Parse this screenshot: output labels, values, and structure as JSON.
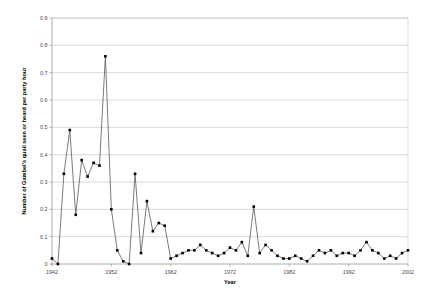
{
  "chart_data": {
    "type": "line",
    "title": "",
    "xlabel": "Year",
    "ylabel": "Number of Gambel's quail seen or heard per party hour",
    "xlim": [
      1942,
      2002
    ],
    "ylim": [
      0,
      0.9
    ],
    "grid": true,
    "legend": false,
    "marker": "square",
    "marker_color": "#000000",
    "line_color": "#595959",
    "gridline_color": "#c8c8c8",
    "x_ticks": [
      "1942",
      "1952",
      "1962",
      "1972",
      "1982",
      "1992",
      "2002"
    ],
    "y_ticks": [
      "0",
      "0.1",
      "0.2",
      "0.3",
      "0.4",
      "0.5",
      "0.6",
      "0.7",
      "0.8",
      "0.9"
    ],
    "x": [
      1942,
      1943,
      1944,
      1945,
      1946,
      1947,
      1948,
      1949,
      1950,
      1951,
      1952,
      1953,
      1954,
      1955,
      1956,
      1957,
      1958,
      1959,
      1960,
      1961,
      1962,
      1963,
      1964,
      1965,
      1966,
      1967,
      1968,
      1969,
      1970,
      1971,
      1972,
      1973,
      1974,
      1975,
      1976,
      1977,
      1978,
      1979,
      1980,
      1981,
      1982,
      1983,
      1984,
      1985,
      1986,
      1987,
      1988,
      1989,
      1990,
      1991,
      1992,
      1993,
      1994,
      1995,
      1996,
      1997,
      1998,
      1999,
      2000,
      2001,
      2002
    ],
    "values": [
      0.02,
      0.0,
      0.33,
      0.49,
      0.18,
      0.38,
      0.32,
      0.37,
      0.36,
      0.76,
      0.2,
      0.05,
      0.01,
      0.0,
      0.33,
      0.04,
      0.23,
      0.12,
      0.15,
      0.14,
      0.02,
      0.03,
      0.04,
      0.05,
      0.05,
      0.07,
      0.05,
      0.04,
      0.03,
      0.04,
      0.06,
      0.05,
      0.08,
      0.03,
      0.21,
      0.04,
      0.07,
      0.05,
      0.03,
      0.02,
      0.02,
      0.03,
      0.02,
      0.01,
      0.03,
      0.05,
      0.04,
      0.05,
      0.03,
      0.04,
      0.04,
      0.03,
      0.05,
      0.08,
      0.05,
      0.04,
      0.02,
      0.03,
      0.02,
      0.04,
      0.05
    ]
  }
}
